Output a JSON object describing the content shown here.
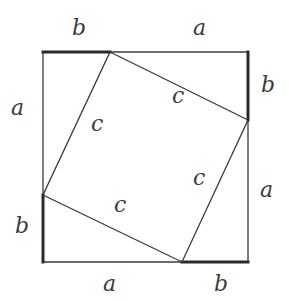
{
  "figure": {
    "outer_square": {
      "side_labels": "a + b"
    },
    "inner_square": {
      "side_label": "c"
    },
    "labels": {
      "top_b": "b",
      "top_a": "a",
      "left_a": "a",
      "left_b": "b",
      "right_b": "b",
      "right_a": "a",
      "bottom_a": "a",
      "bottom_b": "b",
      "inner_c_top_left": "c",
      "inner_c_top_right": "c",
      "inner_c_bottom_right": "c",
      "inner_c_bottom_left": "c"
    },
    "colors": {
      "line": "#3a3a3a",
      "thick_segment": "#2a2a2a",
      "background": "#ffffff"
    }
  }
}
